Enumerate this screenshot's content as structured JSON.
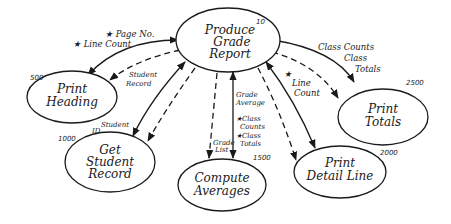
{
  "diagram": {
    "type": "structure-chart",
    "nodes": [
      {
        "id": "produce",
        "number": "10",
        "lines": [
          "Produce",
          "Grade",
          "Report"
        ]
      },
      {
        "id": "heading",
        "number": "500",
        "lines": [
          "Print",
          "Heading"
        ]
      },
      {
        "id": "getrec",
        "number": "1000",
        "lines": [
          "Get",
          "Student",
          "Record"
        ]
      },
      {
        "id": "compute",
        "number": "1500",
        "lines": [
          "Compute",
          "Averages"
        ]
      },
      {
        "id": "detail",
        "number": "2000",
        "lines": [
          "Print",
          "Detail Line"
        ]
      },
      {
        "id": "totals",
        "number": "2500",
        "lines": [
          "Print",
          "Totals"
        ]
      }
    ],
    "labels": {
      "page_no": "★ Page No.",
      "line_count_left": "★ Line Count",
      "student_record_1": "Student",
      "student_record_2": "Record",
      "student_id_1": "Student",
      "student_id_2": "ID",
      "grade_average_1": "Grade",
      "grade_average_2": "Average",
      "class_counts_1": "★Class",
      "class_counts_2": "Counts",
      "class_totals_1": "★Class",
      "class_totals_2": "Totals",
      "grade_list_1": "Grade",
      "grade_list_2": "List",
      "line_count_right_star": "★",
      "line_count_right_1": "Line",
      "line_count_right_2": "Count",
      "totals_label_1": "Class Counts",
      "totals_label_2": "Class",
      "totals_label_3": "Totals"
    }
  }
}
